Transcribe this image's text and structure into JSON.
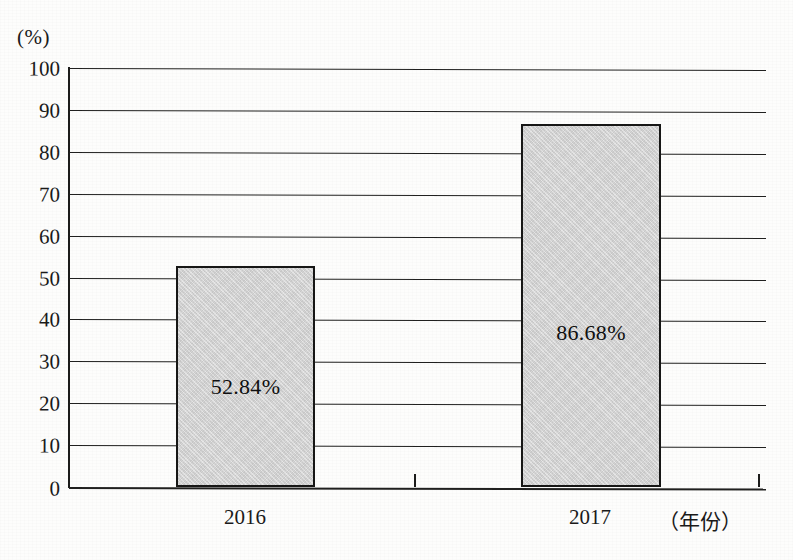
{
  "chart_data": {
    "type": "bar",
    "title": "",
    "subtitle": "",
    "unit_label": "(%)",
    "xlabel": "（年份）",
    "ylabel": "",
    "categories": [
      "2016",
      "2017"
    ],
    "values": [
      52.84,
      86.68
    ],
    "data_labels": [
      "52.84%",
      "86.68%"
    ],
    "ylim": [
      0,
      100
    ],
    "ytick_step": 10,
    "yticks": [
      100,
      90,
      80,
      70,
      60,
      50,
      40,
      30,
      20,
      10,
      0
    ],
    "ytick_labels": [
      "100",
      "90",
      "80",
      "70",
      "60",
      "50",
      "40",
      "30",
      "20",
      "10",
      "0"
    ],
    "grid": true,
    "grid_axis": "y",
    "legend": false,
    "legend_position": "none",
    "series": [
      {
        "name": "",
        "values": [
          52.84,
          86.68
        ]
      }
    ],
    "colors": {
      "bar_fill": "#d2d2d2",
      "bar_border": "#171716",
      "gridline": "#20201f",
      "axis": "#1c1c1b",
      "text": "#1a1a1a",
      "background": "#fdfdfc"
    },
    "bars": [
      {
        "category": "2016",
        "value": 52.84,
        "label": "52.84%",
        "label_y_value": 24
      },
      {
        "category": "2017",
        "value": 86.68,
        "label": "86.68%",
        "label_y_value": 37
      }
    ]
  }
}
